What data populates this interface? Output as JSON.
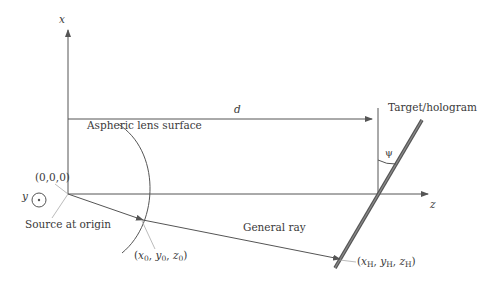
{
  "diagram": {
    "axes": {
      "x_label": "x",
      "y_label": "y",
      "z_label": "z"
    },
    "labels": {
      "origin": "(0,0,0)",
      "source": "Source at origin",
      "lens": "Aspheric lens surface",
      "distance": "d",
      "target": "Target/hologram",
      "angle": "ψ",
      "ray": "General ray",
      "lens_point": {
        "x": "x",
        "x_sub": "0",
        "y": "y",
        "y_sub": "0",
        "z": "z",
        "z_sub": "0"
      },
      "hologram_point": {
        "x": "x",
        "x_sub": "H",
        "y": "y",
        "y_sub": "H",
        "z": "z",
        "z_sub": "H"
      }
    },
    "colors": {
      "line": "#555555",
      "hologram": "#666666",
      "text": "#3a3a3a",
      "leader": "#aaaaaa"
    }
  }
}
